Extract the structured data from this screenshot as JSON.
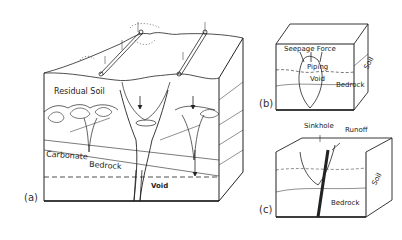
{
  "figure": {
    "panel_a": {
      "tag": "(a)",
      "labels": {
        "residual_soil": "Residual Soil",
        "carbonate": "Carbonate",
        "bedrock": "Bedrock",
        "void": "Void"
      }
    },
    "panel_b": {
      "tag": "(b)",
      "labels": {
        "seepage_force": "Seepage Force",
        "piping": "Piping",
        "void": "Void",
        "bedrock": "Bedrock",
        "soil": "Soil"
      }
    },
    "panel_c": {
      "tag": "(c)",
      "labels": {
        "sinkhole": "Sinkhole",
        "runoff": "Runoff",
        "bedrock": "Bedrock",
        "soil": "Soil"
      }
    }
  },
  "colors": {
    "ink": "#222222",
    "background": "#ffffff"
  }
}
